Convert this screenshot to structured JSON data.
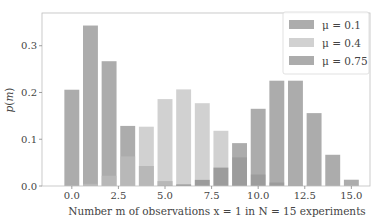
{
  "chart_data": {
    "type": "bar",
    "title": "",
    "xlabel": "Number m of observations x = 1 in N = 15 experiments",
    "ylabel": "p(m)",
    "xlim": [
      -1.6,
      16.0
    ],
    "ylim": [
      0.0,
      0.37
    ],
    "grid": false,
    "legend_position": "upper right",
    "x": [
      0,
      1,
      2,
      3,
      4,
      5,
      6,
      7,
      8,
      9,
      10,
      11,
      12,
      13,
      14,
      15
    ],
    "x_ticks": [
      0.0,
      2.5,
      5.0,
      7.5,
      10.0,
      12.5,
      15.0
    ],
    "x_tick_labels": [
      "0.0",
      "2.5",
      "5.0",
      "7.5",
      "10.0",
      "12.5",
      "15.0"
    ],
    "y_ticks": [
      0.0,
      0.1,
      0.2,
      0.3
    ],
    "y_tick_labels": [
      "0.0",
      "0.1",
      "0.2",
      "0.3"
    ],
    "series": [
      {
        "name": "μ = 0.1",
        "color": "#7f7f7f",
        "alpha": 0.65,
        "values": [
          0.2059,
          0.3432,
          0.2669,
          0.1285,
          0.0428,
          0.0105,
          0.0019,
          0.0003,
          0.0,
          0.0,
          0.0,
          0.0,
          0.0,
          0.0,
          0.0,
          0.0
        ]
      },
      {
        "name": "μ = 0.4",
        "color": "#bdbdbd",
        "alpha": 0.7,
        "values": [
          0.0005,
          0.0047,
          0.0219,
          0.0634,
          0.1268,
          0.1859,
          0.2066,
          0.1771,
          0.1181,
          0.0612,
          0.0245,
          0.0074,
          0.0016,
          0.0003,
          0.0,
          0.0
        ]
      },
      {
        "name": "μ = 0.75",
        "color": "#7f7f7f",
        "alpha": 0.65,
        "values": [
          0.0,
          0.0,
          0.0,
          0.0,
          0.0,
          0.0007,
          0.0034,
          0.0131,
          0.0393,
          0.0917,
          0.1651,
          0.2252,
          0.2252,
          0.1559,
          0.0668,
          0.0134
        ]
      }
    ]
  },
  "legend": {
    "items": [
      {
        "label": "μ = 0.1"
      },
      {
        "label": "μ = 0.4"
      },
      {
        "label": "μ = 0.75"
      }
    ]
  },
  "axes": {
    "ylabel": "p(m)",
    "xlabel": "Number m of observations x = 1 in N = 15 experiments"
  }
}
